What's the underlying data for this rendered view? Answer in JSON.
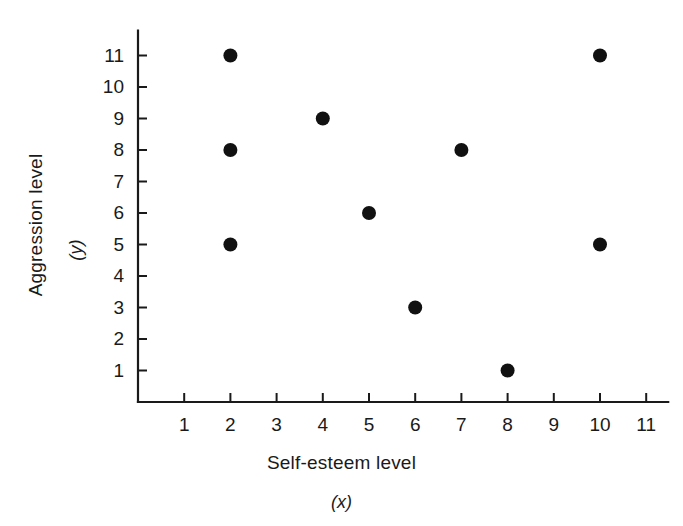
{
  "chart_data": {
    "type": "scatter",
    "title": "",
    "xlabel": "Self-esteem level",
    "xlabel_symbol": "(x)",
    "ylabel": "Aggression level",
    "ylabel_symbol": "(y)",
    "xlim": [
      0,
      11.6
    ],
    "ylim": [
      0,
      11.8
    ],
    "xticks": [
      1,
      2,
      3,
      4,
      5,
      6,
      7,
      8,
      9,
      10,
      11
    ],
    "yticks": [
      1,
      2,
      3,
      4,
      5,
      6,
      7,
      8,
      9,
      10,
      11
    ],
    "xtick_labels": [
      "1",
      "2",
      "3",
      "4",
      "5",
      "6",
      "7",
      "8",
      "9",
      "10",
      "11"
    ],
    "ytick_labels": [
      "1",
      "2",
      "3",
      "4",
      "5",
      "6",
      "7",
      "8",
      "9",
      "10",
      "11"
    ],
    "grid": false,
    "legend": null,
    "marker": "filled-circle",
    "marker_color": "#111111",
    "points": [
      {
        "x": 2,
        "y": 11
      },
      {
        "x": 2,
        "y": 8
      },
      {
        "x": 2,
        "y": 5
      },
      {
        "x": 4,
        "y": 9
      },
      {
        "x": 5,
        "y": 6
      },
      {
        "x": 6,
        "y": 3
      },
      {
        "x": 7,
        "y": 8
      },
      {
        "x": 8,
        "y": 1
      },
      {
        "x": 10,
        "y": 11
      },
      {
        "x": 10,
        "y": 5
      }
    ]
  }
}
